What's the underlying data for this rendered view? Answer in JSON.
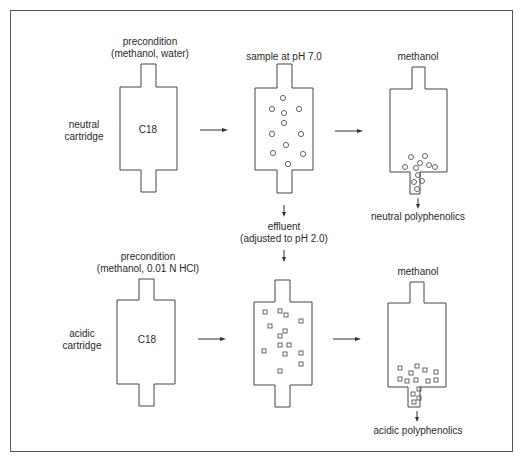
{
  "rows": [
    {
      "id": "neutral",
      "row_label": [
        "neutral",
        "cartridge"
      ],
      "step1": {
        "title": [
          "precondition",
          "(methanol, water)"
        ],
        "content": "C18"
      },
      "step2": {
        "title": [
          "sample at pH 7.0"
        ],
        "particle": "circle"
      },
      "step3": {
        "title": [
          "methanol"
        ],
        "output": "neutral polyphenolics"
      }
    },
    {
      "id": "acidic",
      "row_label": [
        "acidic",
        "cartridge"
      ],
      "step1": {
        "title": [
          "precondition",
          "(methanol, 0.01 N HCl)"
        ],
        "content": "C18"
      },
      "step2": {
        "title": [
          "effluent",
          "(adjusted to pH 2.0)"
        ],
        "particle": "square"
      },
      "step3": {
        "title": [
          "methanol"
        ],
        "output": "acidic polyphenolics"
      }
    }
  ]
}
